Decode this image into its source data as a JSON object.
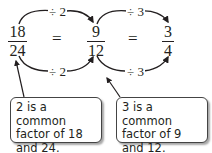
{
  "fractions": [
    {
      "numerator": "18",
      "denominator": "24"
    },
    {
      "numerator": "9",
      "denominator": "12"
    },
    {
      "numerator": "3",
      "denominator": "4"
    }
  ],
  "equals": [
    "=",
    "="
  ],
  "operations": {
    "top": [
      "÷ 2",
      "÷ 3"
    ],
    "bottom": [
      "÷ 2",
      "÷ 3"
    ]
  },
  "callouts": [
    {
      "text": "2 is a common factor of 18 and 24."
    },
    {
      "text": "3 is a common factor of 9 and 12."
    }
  ],
  "colors": {
    "ink": "#231f20",
    "box_border": "#444444"
  }
}
